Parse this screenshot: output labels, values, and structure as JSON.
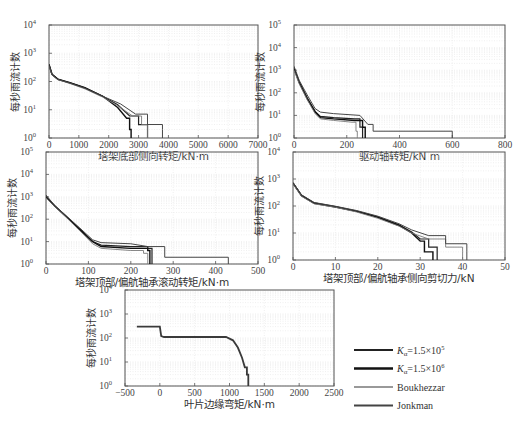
{
  "figure": {
    "legend": [
      {
        "label": "Kα=1.5×10",
        "exp": "5",
        "color": "#222222",
        "width": 2.2
      },
      {
        "label": "Kα=1.5×10",
        "exp": "6",
        "color": "#111111",
        "width": 2.6
      },
      {
        "label": "Boukhezzar",
        "exp": "",
        "color": "#777777",
        "width": 1.6
      },
      {
        "label": "Jonkman",
        "exp": "",
        "color": "#444444",
        "width": 1.8
      }
    ]
  },
  "chart_data": [
    {
      "type": "line",
      "title": "",
      "xlabel": "塔架底部侧向转矩/kN·m",
      "ylabel": "每秒雨流计数",
      "xlim": [
        0,
        7000
      ],
      "ylim_log10": [
        0,
        4
      ],
      "xticks": [
        "0",
        "1000",
        "2000",
        "3000",
        "4000",
        "5000",
        "6000",
        "7000"
      ],
      "yticks": [
        "10^0",
        "10^1",
        "10^2",
        "10^3",
        "10^4"
      ],
      "grid": true,
      "series": [
        {
          "name": "Kα=1.5×10^5",
          "x": [
            0,
            100,
            300,
            700,
            1200,
            1800,
            2300,
            2700,
            3000,
            3300,
            3300
          ],
          "y": [
            400,
            180,
            120,
            90,
            60,
            30,
            15,
            6,
            3,
            2,
            1
          ]
        },
        {
          "name": "Kα=1.5×10^6",
          "x": [
            0,
            100,
            300,
            700,
            1200,
            1800,
            2300,
            2600,
            2700,
            2750,
            2750
          ],
          "y": [
            400,
            180,
            120,
            90,
            60,
            30,
            12,
            5,
            2,
            1.2,
            1
          ]
        },
        {
          "name": "Boukhezzar",
          "x": [
            0,
            100,
            300,
            700,
            1200,
            1800,
            2300,
            2800,
            3100,
            3300,
            3300
          ],
          "y": [
            350,
            170,
            115,
            85,
            55,
            28,
            14,
            6,
            3,
            1.5,
            1
          ]
        },
        {
          "name": "Jonkman",
          "x": [
            0,
            100,
            300,
            700,
            1200,
            1800,
            2400,
            2900,
            3300,
            3800,
            3800
          ],
          "y": [
            380,
            175,
            118,
            88,
            58,
            30,
            16,
            7,
            3,
            2,
            1
          ]
        }
      ]
    },
    {
      "type": "line",
      "xlabel": "驱动轴转矩/kN m",
      "ylabel": "每秒雨流计数",
      "xlim": [
        0,
        800
      ],
      "ylim_log10": [
        0,
        5
      ],
      "xticks": [
        "0",
        "200",
        "400",
        "600",
        "800"
      ],
      "yticks": [
        "10^0",
        "10^1",
        "10^2",
        "10^3",
        "10^4",
        "10^5"
      ],
      "grid": true,
      "series": [
        {
          "name": "Kα=1.5×10^5",
          "x": [
            0,
            20,
            50,
            80,
            100,
            150,
            230,
            250,
            260,
            260
          ],
          "y": [
            1200,
            300,
            60,
            15,
            9,
            8,
            7,
            3,
            1.5,
            1
          ]
        },
        {
          "name": "Kα=1.5×10^6",
          "x": [
            0,
            20,
            50,
            80,
            100,
            150,
            230,
            260,
            270,
            270
          ],
          "y": [
            1200,
            280,
            55,
            14,
            8,
            7,
            6,
            3,
            1.5,
            1
          ]
        },
        {
          "name": "Boukhezzar",
          "x": [
            0,
            20,
            50,
            80,
            100,
            150,
            220,
            235,
            240,
            240
          ],
          "y": [
            1000,
            250,
            50,
            12,
            7,
            6,
            5,
            2,
            1.2,
            1
          ]
        },
        {
          "name": "Jonkman",
          "x": [
            0,
            20,
            50,
            80,
            100,
            150,
            250,
            280,
            300,
            600,
            600
          ],
          "y": [
            1500,
            350,
            80,
            20,
            14,
            12,
            10,
            4,
            2,
            2,
            1
          ]
        }
      ]
    },
    {
      "type": "line",
      "xlabel": "塔架顶部/偏航轴承滚动转矩/kN·m",
      "ylabel": "每秒雨流计数",
      "xlim": [
        0,
        500
      ],
      "ylim_log10": [
        0,
        5
      ],
      "xticks": [
        "0",
        "100",
        "200",
        "300",
        "400",
        "500"
      ],
      "yticks": [
        "10^0",
        "10^1",
        "10^2",
        "10^3",
        "10^4",
        "10^5"
      ],
      "grid": true,
      "series": [
        {
          "name": "Kα=1.5×10^5",
          "x": [
            0,
            20,
            50,
            80,
            110,
            130,
            200,
            240,
            250,
            250
          ],
          "y": [
            1000,
            400,
            120,
            35,
            10,
            7,
            6,
            5,
            2,
            1
          ]
        },
        {
          "name": "Kα=1.5×10^6",
          "x": [
            0,
            20,
            50,
            80,
            110,
            130,
            200,
            240,
            245,
            245
          ],
          "y": [
            1000,
            400,
            120,
            35,
            10,
            6,
            5,
            4,
            2,
            1
          ]
        },
        {
          "name": "Boukhezzar",
          "x": [
            0,
            20,
            50,
            80,
            110,
            130,
            200,
            230,
            240,
            240
          ],
          "y": [
            900,
            380,
            110,
            30,
            8,
            5,
            4,
            3,
            1.5,
            1
          ]
        },
        {
          "name": "Jonkman",
          "x": [
            0,
            20,
            50,
            80,
            110,
            130,
            200,
            240,
            280,
            430,
            430
          ],
          "y": [
            1200,
            420,
            130,
            40,
            12,
            9,
            8,
            6,
            2,
            2,
            1
          ]
        }
      ]
    },
    {
      "type": "line",
      "xlabel": "塔架顶部/偏航轴承侧向剪切力/kN",
      "ylabel": "每秒雨流计数",
      "xlim": [
        0,
        50
      ],
      "ylim_log10": [
        0,
        4
      ],
      "xticks": [
        "0",
        "10",
        "20",
        "30",
        "40",
        "50"
      ],
      "yticks": [
        "10^0",
        "10^1",
        "10^2",
        "10^3",
        "10^4"
      ],
      "grid": true,
      "series": [
        {
          "name": "Kα=1.5×10^5",
          "x": [
            0,
            2,
            5,
            10,
            15,
            20,
            25,
            28,
            30,
            32,
            34,
            34
          ],
          "y": [
            700,
            250,
            130,
            95,
            65,
            40,
            20,
            11,
            6,
            3,
            2,
            1
          ]
        },
        {
          "name": "Kα=1.5×10^6",
          "x": [
            0,
            2,
            5,
            10,
            15,
            20,
            25,
            28,
            30,
            31,
            33,
            33
          ],
          "y": [
            700,
            240,
            125,
            92,
            63,
            38,
            19,
            10,
            5,
            2,
            1.5,
            1
          ]
        },
        {
          "name": "Boukhezzar",
          "x": [
            0,
            2,
            5,
            10,
            15,
            20,
            25,
            28,
            32,
            36,
            40,
            40
          ],
          "y": [
            650,
            230,
            120,
            90,
            60,
            35,
            18,
            10,
            6,
            3,
            2,
            1
          ]
        },
        {
          "name": "Jonkman",
          "x": [
            0,
            2,
            5,
            10,
            15,
            20,
            25,
            28,
            32,
            36,
            41,
            41
          ],
          "y": [
            750,
            260,
            135,
            98,
            68,
            42,
            22,
            13,
            8,
            4,
            2,
            1
          ]
        }
      ]
    },
    {
      "type": "line",
      "xlabel": "叶片边缘弯矩/kN·m",
      "ylabel": "每秒雨流计数",
      "xlim": [
        -500,
        2500
      ],
      "ylim_log10": [
        0,
        4
      ],
      "xticks": [
        "-500",
        "0",
        "500",
        "1000",
        "1500",
        "2000",
        "2500"
      ],
      "yticks": [
        "10^0",
        "10^1",
        "10^2",
        "10^3",
        "10^4"
      ],
      "grid": true,
      "series": [
        {
          "name": "all (overlapping)",
          "x": [
            -330,
            0,
            20,
            60,
            950,
            1050,
            1120,
            1180,
            1220,
            1250,
            1270,
            1270
          ],
          "y": [
            300,
            300,
            120,
            110,
            110,
            80,
            40,
            15,
            6,
            3,
            1.5,
            1
          ]
        }
      ]
    }
  ]
}
